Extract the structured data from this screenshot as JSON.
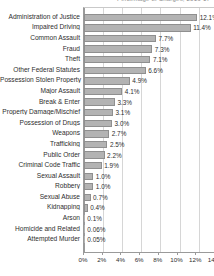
{
  "header": {
    "clipped_title": "Percentage of Charges, 2016-17"
  },
  "colors": {
    "bar_fill": "#b3b3b3",
    "bar_stroke": "#8f8f8f",
    "gridline": "#d6d6d6",
    "axis": "#9a9a9a",
    "text": "#2e2e2e",
    "background": "#ffffff"
  },
  "chart_data": {
    "type": "bar",
    "orientation": "horizontal",
    "title": "",
    "xlabel": "",
    "ylabel": "",
    "xlim": [
      0,
      14
    ],
    "xticks": [
      0,
      2,
      4,
      6,
      8,
      10,
      12,
      14
    ],
    "xticklabels": [
      "0%",
      "2%",
      "4%",
      "6%",
      "8%",
      "10%",
      "12%",
      "14%"
    ],
    "grid": true,
    "legend": false,
    "categories": [
      "Administration of Justice",
      "Impaired Driving",
      "Common Assault",
      "Fraud",
      "Theft",
      "Other Federal Statutes",
      "Possession Stolen Property",
      "Major Assault",
      "Break & Enter",
      "Property Damage/Mischief",
      "Possession of Drugs",
      "Weapons",
      "Trafficking",
      "Public Order",
      "Criminal Code Traffic",
      "Sexual Assault",
      "Robbery",
      "Sexual Abuse",
      "Kidnapping",
      "Arson",
      "Homicide and Related",
      "Attempted Murder"
    ],
    "values": [
      12.1,
      11.4,
      7.7,
      7.3,
      7.1,
      6.6,
      4.9,
      4.1,
      3.3,
      3.1,
      3.0,
      2.7,
      2.5,
      2.2,
      1.9,
      1.0,
      1.0,
      0.7,
      0.4,
      0.1,
      0.06,
      0.05
    ],
    "value_labels": [
      "12.1%",
      "11.4%",
      "7.7%",
      "7.3%",
      "7.1%",
      "6.6%",
      "4.9%",
      "4.1%",
      "3.3%",
      "3.1%",
      "3.0%",
      "2.7%",
      "2.5%",
      "2.2%",
      "1.9%",
      "1.0%",
      "1.0%",
      "0.7%",
      "0.4%",
      "0.1%",
      "0.06%",
      "0.05%"
    ]
  }
}
